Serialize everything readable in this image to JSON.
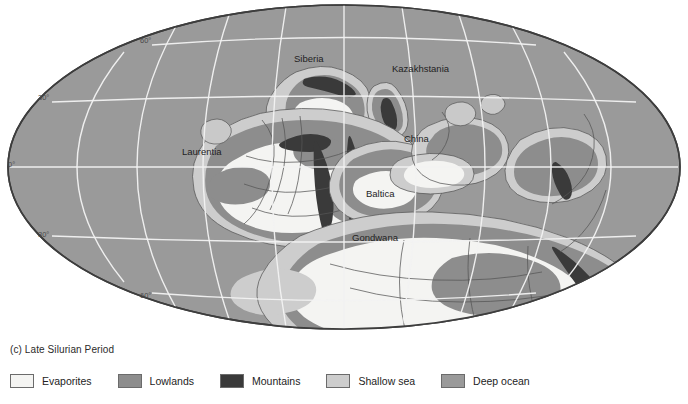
{
  "figure": {
    "caption": "(c) Late Silurian Period",
    "projection": "elliptical",
    "background_color": "#ffffff"
  },
  "map": {
    "ocean_color": "#9a9a9a",
    "frame_stroke": "#3d3d3d",
    "graticule_color": "#f2f2f2",
    "latitude_labels": [
      {
        "text": "60°",
        "x": 140,
        "y": 43
      },
      {
        "text": "30°",
        "x": 38,
        "y": 100
      },
      {
        "text": "0°",
        "x": 8,
        "y": 167
      },
      {
        "text": "30°",
        "x": 38,
        "y": 237
      },
      {
        "text": "60°",
        "x": 140,
        "y": 298
      }
    ],
    "region_labels": [
      {
        "name": "Siberia",
        "text": "Siberia",
        "x": 294,
        "y": 62
      },
      {
        "name": "Kazakhstania",
        "text": "Kazakhstania",
        "x": 392,
        "y": 72
      },
      {
        "name": "Laurentia",
        "text": "Laurentia",
        "x": 182,
        "y": 155
      },
      {
        "name": "China",
        "text": "China",
        "x": 404,
        "y": 142
      },
      {
        "name": "Baltica",
        "text": "Baltica",
        "x": 366,
        "y": 197
      },
      {
        "name": "Gondwana",
        "text": "Gondwana",
        "x": 352,
        "y": 241
      }
    ]
  },
  "legend": {
    "items": [
      {
        "label": "Evaporites",
        "color": "#f4f4f2"
      },
      {
        "label": "Lowlands",
        "color": "#8d8d8d"
      },
      {
        "label": "Mountains",
        "color": "#3a3a3a"
      },
      {
        "label": "Shallow sea",
        "color": "#cdcdcd"
      },
      {
        "label": "Deep ocean",
        "color": "#9a9a9a"
      }
    ]
  }
}
